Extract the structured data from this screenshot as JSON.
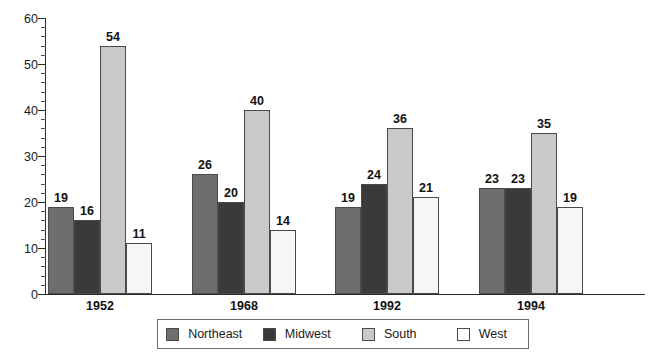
{
  "chart_data": {
    "type": "bar",
    "title": "",
    "xlabel": "",
    "ylabel": "",
    "ylim": [
      0,
      60
    ],
    "y_ticks": [
      0,
      10,
      20,
      30,
      40,
      50,
      60
    ],
    "y_tick_labels": [
      "0",
      "10",
      "20",
      "30",
      "40",
      "50",
      "60"
    ],
    "y_minor_tick_step": 2,
    "grid": false,
    "legend_position": "bottom",
    "categories": [
      "1952",
      "1968",
      "1992",
      "1994"
    ],
    "series": [
      {
        "name": "Northeast",
        "color": "#6e6e6e",
        "values": [
          19,
          26,
          19,
          23
        ]
      },
      {
        "name": "Midwest",
        "color": "#3a3a3a",
        "values": [
          16,
          20,
          24,
          23
        ]
      },
      {
        "name": "South",
        "color": "#c9c9c9",
        "values": [
          54,
          40,
          36,
          35
        ]
      },
      {
        "name": "West",
        "color": "#f6f6f6",
        "values": [
          11,
          14,
          21,
          19
        ]
      }
    ],
    "value_labels": [
      [
        "19",
        "16",
        "54",
        "11"
      ],
      [
        "26",
        "20",
        "40",
        "14"
      ],
      [
        "19",
        "24",
        "36",
        "21"
      ],
      [
        "23",
        "23",
        "35",
        "19"
      ]
    ]
  }
}
